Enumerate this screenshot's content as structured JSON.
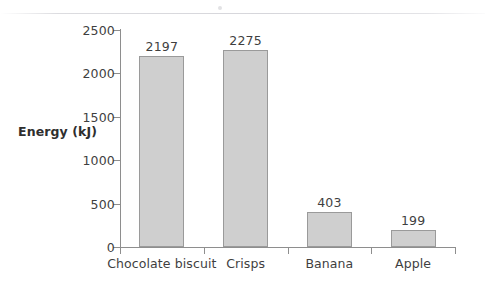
{
  "chart_data": {
    "type": "bar",
    "title": "",
    "xlabel": "",
    "ylabel": "Energy (kJ)",
    "categories": [
      "Chocolate biscuit",
      "Crisps",
      "Banana",
      "Apple"
    ],
    "values": [
      2197,
      2275,
      403,
      199
    ],
    "value_labels": [
      "2197",
      "2275",
      "403",
      "199"
    ],
    "ylim": [
      0,
      2500
    ],
    "yticks": [
      0,
      500,
      1000,
      1500,
      2000,
      2500
    ],
    "ytick_labels": [
      "0",
      "500",
      "1000",
      "1500",
      "2000",
      "2500"
    ],
    "grid": false,
    "legend": null,
    "bar_color": "#cfcfcf",
    "bar_border_color": "#9a9a9a",
    "axis_color": "#8e8e8e",
    "text_color": "#3f3f3f"
  }
}
